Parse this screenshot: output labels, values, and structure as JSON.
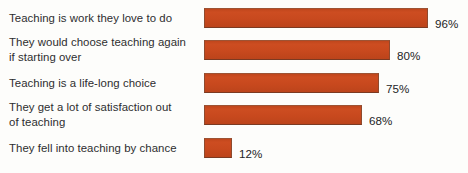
{
  "chart_data": {
    "type": "bar",
    "orientation": "horizontal",
    "title": "",
    "subtitle": "",
    "xlabel": "",
    "ylabel": "",
    "xlim": [
      0,
      100
    ],
    "grid": false,
    "legend": false,
    "value_suffix": "%",
    "bar_color": "#c9491d",
    "bar_border_color": "#8e4a2e",
    "background_color": "#fdfdfb",
    "text_color": "#2d2d2f",
    "categories": [
      "Teaching is work they love to do",
      "They would choose teaching again if starting over",
      "Teaching is a life-long choice",
      "They get a lot of satisfaction out of teaching",
      "They fell into teaching by chance"
    ],
    "values": [
      96,
      80,
      75,
      68,
      12
    ],
    "value_labels": [
      "96%",
      "80%",
      "75%",
      "68%",
      "12%"
    ]
  },
  "rows": [
    {
      "label_lines": [
        "Teaching is work they love to do"
      ],
      "value": 96,
      "value_label": "96%"
    },
    {
      "label_lines": [
        "They would choose teaching again",
        "if starting over"
      ],
      "value": 80,
      "value_label": "80%"
    },
    {
      "label_lines": [
        "Teaching is a life-long choice"
      ],
      "value": 75,
      "value_label": "75%"
    },
    {
      "label_lines": [
        "They get a lot of satisfaction out",
        "of teaching"
      ],
      "value": 68,
      "value_label": "68%"
    },
    {
      "label_lines": [
        "They fell into teaching by chance"
      ],
      "value": 12,
      "value_label": "12%"
    }
  ]
}
